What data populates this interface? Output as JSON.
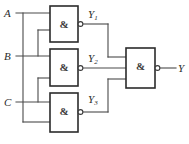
{
  "figure": {
    "colors": {
      "wire": "#4a4a4a",
      "gate_outline": "#2b2b2b",
      "background": "#ffffff",
      "text": "#2b2b2b"
    }
  },
  "inputs": [
    {
      "id": "A",
      "label": "A"
    },
    {
      "id": "B",
      "label": "B"
    },
    {
      "id": "C",
      "label": "C"
    }
  ],
  "gates": [
    {
      "id": "g1",
      "symbol": "&",
      "type": "NAND",
      "output_label": "Y",
      "output_sub": "1"
    },
    {
      "id": "g2",
      "symbol": "&",
      "type": "NAND",
      "output_label": "Y",
      "output_sub": "2"
    },
    {
      "id": "g3",
      "symbol": "&",
      "type": "NAND",
      "output_label": "Y",
      "output_sub": "3"
    },
    {
      "id": "g4",
      "symbol": "&",
      "type": "NAND",
      "output_label": "Y",
      "output_sub": ""
    }
  ],
  "outputs": [
    {
      "id": "Y",
      "label": "Y"
    }
  ]
}
